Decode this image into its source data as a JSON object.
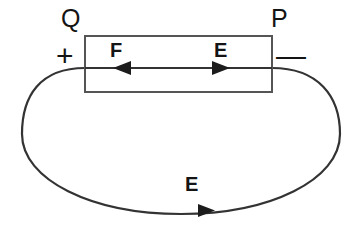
{
  "figure": {
    "type": "physics-circuit-diagram",
    "width": 362,
    "height": 239,
    "background_color": "#ffffff",
    "stroke_color": "#333333",
    "text_color": "#141414"
  },
  "labels": {
    "terminal_left": "Q",
    "terminal_right": "P",
    "polarity_positive": "+",
    "polarity_negative": "—",
    "force_internal": "F",
    "field_internal": "E",
    "field_external": "E"
  },
  "battery": {
    "name": "battery-rectangle",
    "x": 85,
    "y": 36,
    "width": 187,
    "height": 56
  },
  "internal_line": {
    "name": "internal-axis-line",
    "x1": 85,
    "x2": 272,
    "y": 68
  },
  "arrows": {
    "force_left": {
      "name": "force-arrow-left",
      "tip_x": 113,
      "y": 68,
      "direction": "left"
    },
    "field_right": {
      "name": "field-arrow-right",
      "tip_x": 230,
      "y": 68,
      "direction": "right"
    },
    "external_current": {
      "name": "external-current-arrow",
      "tip_x": 215,
      "y": 210,
      "direction": "right"
    }
  },
  "loop": {
    "name": "external-circuit-loop",
    "left_x": 22,
    "right_x": 340,
    "top_y": 68,
    "bottom_y": 214
  }
}
